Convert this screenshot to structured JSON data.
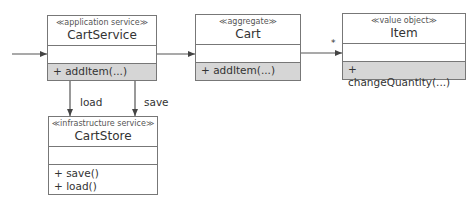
{
  "diagram": {
    "type": "uml-class-diagram",
    "classes": [
      {
        "id": "cart-service",
        "stereotype": "≪application service≫",
        "name": "CartService",
        "attributes": [],
        "operations": [
          "+ addItem(...)"
        ],
        "ops_highlight_color": "#d6d6d6"
      },
      {
        "id": "cart",
        "stereotype": "≪aggregate≫",
        "name": "Cart",
        "attributes": [],
        "operations": [
          "+ addItem(...)"
        ],
        "ops_highlight_color": "#d6d6d6"
      },
      {
        "id": "item",
        "stereotype": "≪value object≫",
        "name": "Item",
        "attributes": [],
        "operations": [
          "+ changeQuantity(...)"
        ],
        "ops_highlight_color": "#d6d6d6"
      },
      {
        "id": "cart-store",
        "stereotype": "≪infrastructure service≫",
        "name": "CartStore",
        "attributes": [],
        "operations": [
          "+ save()",
          "+ load()"
        ]
      }
    ],
    "edges": [
      {
        "from": "external",
        "to": "cart-service",
        "label": ""
      },
      {
        "from": "cart-service",
        "to": "cart",
        "label": ""
      },
      {
        "from": "cart",
        "to": "item",
        "label": "",
        "multiplicity": "*"
      },
      {
        "from": "cart-service",
        "to": "cart-store",
        "label": "load"
      },
      {
        "from": "cart-service",
        "to": "cart-store",
        "label": "save"
      }
    ],
    "colors": {
      "line": "#555555",
      "border": "#777777",
      "highlight": "#d6d6d6"
    }
  }
}
